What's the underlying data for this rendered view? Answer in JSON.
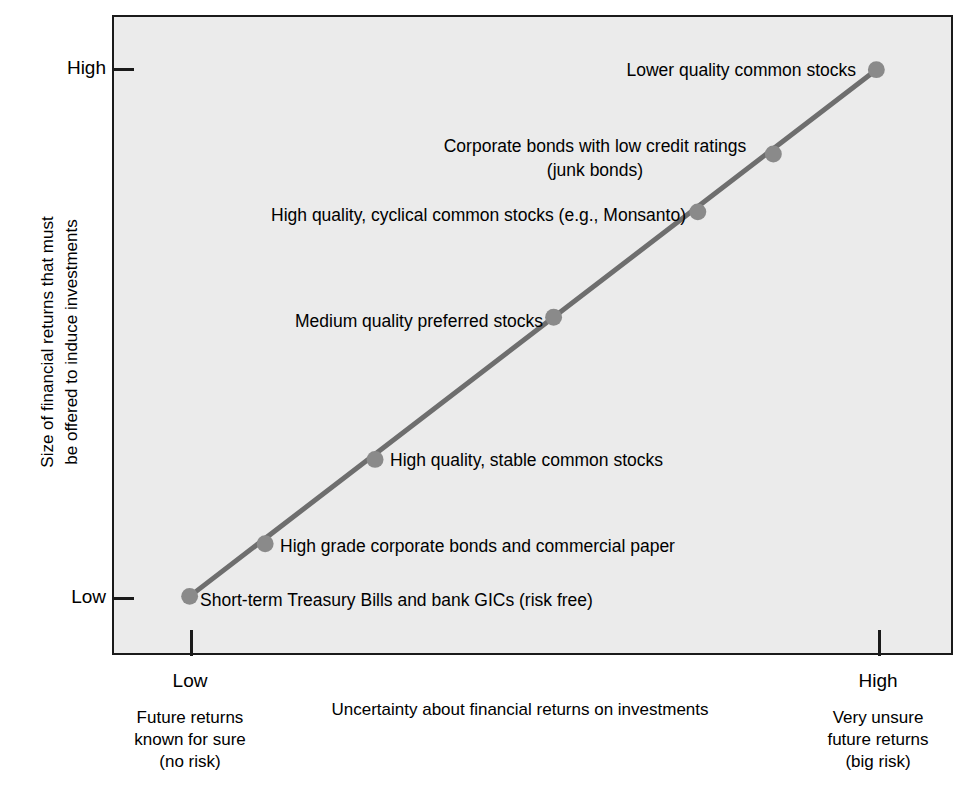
{
  "chart_data": {
    "type": "line",
    "title": "",
    "subtitle": "",
    "xlabel": "Uncertainty about financial returns on investments",
    "ylabel": "Size of financial returns that must\nbe offered to induce investments",
    "xlim": [
      0,
      1
    ],
    "ylim": [
      0,
      1
    ],
    "grid": false,
    "legend": "none",
    "x_axis": {
      "ticks": [
        {
          "value": 0.0,
          "label": "Low",
          "sublabel": "Future returns\nknown for sure\n(no risk)"
        },
        {
          "value": 1.0,
          "label": "High",
          "sublabel": "Very unsure\nfuture returns\n(big risk)"
        }
      ]
    },
    "y_axis": {
      "ticks": [
        {
          "value": 1.0,
          "label": "High"
        },
        {
          "value": 0.0,
          "label": "Low"
        }
      ]
    },
    "series": [
      {
        "name": "Risk-return tradeoff",
        "line_color": "#6e6e6e",
        "marker_color": "#8a8a8a",
        "points": [
          {
            "x": 0.0,
            "y": 0.0,
            "label": "Short-term Treasury Bills and bank GICs (risk free)",
            "label_anchor": "left"
          },
          {
            "x": 0.11,
            "y": 0.1,
            "label": "High grade corporate bonds and commercial paper",
            "label_anchor": "left"
          },
          {
            "x": 0.27,
            "y": 0.26,
            "label": "High quality, stable common stocks",
            "label_anchor": "left"
          },
          {
            "x": 0.53,
            "y": 0.53,
            "label": "Medium quality preferred stocks",
            "label_anchor": "right"
          },
          {
            "x": 0.74,
            "y": 0.73,
            "label": "High quality, cyclical common stocks (e.g., Monsanto)",
            "label_anchor": "right"
          },
          {
            "x": 0.85,
            "y": 0.84,
            "label": "Corporate bonds with low credit ratings\n(junk bonds)",
            "label_anchor": "right"
          },
          {
            "x": 1.0,
            "y": 1.0,
            "label": "Lower quality common stocks",
            "label_anchor": "right"
          }
        ]
      }
    ],
    "colors": {
      "plot_background": "#ebebeb",
      "axis": "#1a1a1a",
      "line": "#6e6e6e",
      "marker": "#8a8a8a",
      "text": "#000000",
      "page_background": "#ffffff"
    }
  },
  "labels": {
    "y_title": "Size of financial returns that must\nbe offered to induce investments",
    "y_high": "High",
    "y_low": "Low",
    "x_title": "Uncertainty about financial returns on investments",
    "x_low": "Low",
    "x_high": "High",
    "x_low_sub": "Future returns\nknown for sure\n(no risk)",
    "x_high_sub": "Very unsure\nfuture returns\n(big risk)",
    "p0": "Short-term Treasury Bills and bank GICs (risk free)",
    "p1": "High grade corporate bonds and commercial paper",
    "p2": "High quality, stable common stocks",
    "p3": "Medium quality preferred stocks",
    "p4": "High quality, cyclical common stocks (e.g., Monsanto)",
    "p5": "Corporate bonds with low credit ratings\n(junk bonds)",
    "p6": "Lower quality common stocks"
  }
}
